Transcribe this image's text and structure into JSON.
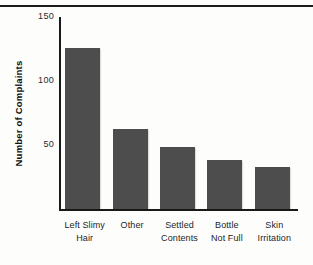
{
  "chart_data": {
    "type": "bar",
    "title": "",
    "subtitle": "",
    "xlabel": "",
    "ylabel": "Number of Complaints",
    "categories": [
      "Left Slimy Hair",
      "Other",
      "Settled Contents",
      "Bottle Not Full",
      "Skin Irritation"
    ],
    "category_lines": [
      [
        "Left Slimy",
        "Hair"
      ],
      [
        "Other",
        ""
      ],
      [
        "Settled",
        "Contents"
      ],
      [
        "Bottle",
        "Not Full"
      ],
      [
        "Skin",
        "Irritation"
      ]
    ],
    "values": [
      125,
      62,
      48,
      38,
      33
    ],
    "ylim": [
      0,
      150
    ],
    "yticks": [
      50,
      100,
      150
    ],
    "ytick_labels": [
      "50",
      "100",
      "150"
    ],
    "grid": false,
    "legend": null,
    "bar_color": "#4d4d4d",
    "axis_color": "#1a1a1a",
    "background_color": "#fdfdfc",
    "annotations": []
  }
}
